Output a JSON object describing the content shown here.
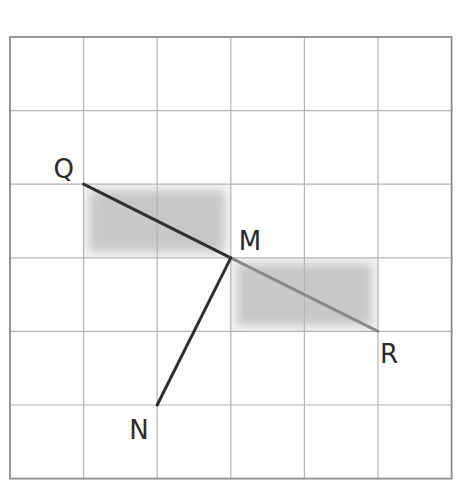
{
  "grid": {
    "cols": 6,
    "rows": 6,
    "origin_x": 10,
    "origin_y": 37,
    "cell": 73.6,
    "line_color": "#b4b4b4",
    "border_color": "#8c8c8c"
  },
  "shaded_regions": [
    {
      "name": "rect-QM",
      "col": 1,
      "row": 2,
      "width_cells": 2,
      "height_cells": 1,
      "color": "#c8c8c8"
    },
    {
      "name": "rect-MR",
      "col": 3,
      "row": 3,
      "width_cells": 2,
      "height_cells": 1,
      "color": "#c8c8c8"
    }
  ],
  "points": [
    {
      "label": "Q",
      "gx": 1,
      "gy": 2,
      "label_dx": -30,
      "label_dy": -6
    },
    {
      "label": "M",
      "gx": 3,
      "gy": 3,
      "label_dx": 8,
      "label_dy": -8
    },
    {
      "label": "R",
      "gx": 5,
      "gy": 4,
      "label_dx": 2,
      "label_dy": 32
    },
    {
      "label": "N",
      "gx": 2,
      "gy": 5,
      "label_dx": -28,
      "label_dy": 34
    }
  ],
  "segments": [
    {
      "name": "segment-QM",
      "from": "Q",
      "to": "M",
      "color": "#2e2e2e",
      "width": 3
    },
    {
      "name": "segment-MR",
      "from": "M",
      "to": "R",
      "color": "#8a8a8a",
      "width": 3
    },
    {
      "name": "segment-MN",
      "from": "M",
      "to": "N",
      "color": "#2e2e2e",
      "width": 3
    }
  ],
  "labels": {
    "Q": "Q",
    "M": "M",
    "R": "R",
    "N": "N"
  }
}
